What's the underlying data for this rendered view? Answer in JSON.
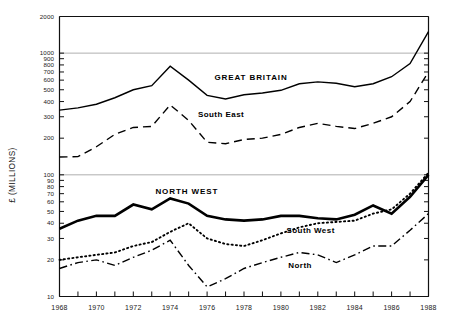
{
  "chart_data": {
    "type": "line",
    "title": "",
    "xlabel": "",
    "ylabel": "£ (MILLIONS)",
    "y_scale": "log",
    "ylim": [
      10,
      2000
    ],
    "xlim": [
      1968,
      1988
    ],
    "grid": "horizontal-at-100-and-1000",
    "legend_position": "inline-annotations",
    "x_tick_labels": [
      "1968",
      "1970",
      "1972",
      "1974",
      "1976",
      "1978",
      "1980",
      "1982",
      "1984",
      "1986",
      "1988"
    ],
    "x_minor_ticks": [
      1969,
      1971,
      1973,
      1975,
      1977,
      1979,
      1981,
      1983,
      1985,
      1987
    ],
    "y_tick_labels": [
      "2000",
      "1000",
      "900",
      "800",
      "700",
      "600",
      "500",
      "400",
      "300",
      "200",
      "100",
      "90",
      "80",
      "70",
      "60",
      "50",
      "40",
      "30",
      "20",
      "10"
    ],
    "y_tick_values": [
      2000,
      1000,
      900,
      800,
      700,
      600,
      500,
      400,
      300,
      200,
      100,
      90,
      80,
      70,
      60,
      50,
      40,
      30,
      20,
      10
    ],
    "x": [
      1968,
      1969,
      1970,
      1971,
      1972,
      1973,
      1974,
      1975,
      1976,
      1977,
      1978,
      1979,
      1980,
      1981,
      1982,
      1983,
      1984,
      1985,
      1986,
      1987,
      1988
    ],
    "series": [
      {
        "name": "GREAT BRITAIN",
        "style": "solid",
        "width": 1.4,
        "label_x": 1976.4,
        "label_y": 600,
        "values": [
          340,
          355,
          380,
          430,
          500,
          540,
          780,
          600,
          450,
          420,
          455,
          470,
          495,
          560,
          580,
          565,
          530,
          560,
          640,
          820,
          1500
        ]
      },
      {
        "name": "South East",
        "style": "dashed",
        "width": 1.4,
        "label_x": 1975.5,
        "label_y": 300,
        "values": [
          140,
          141,
          170,
          215,
          245,
          250,
          375,
          280,
          185,
          180,
          195,
          200,
          215,
          245,
          265,
          250,
          240,
          265,
          300,
          400,
          700
        ]
      },
      {
        "name": "NORTH WEST",
        "style": "solid",
        "width": 2.6,
        "label_x": 1973.2,
        "label_y": 70,
        "values": [
          36,
          42,
          46,
          46,
          57,
          52,
          64,
          58,
          46,
          43,
          42,
          43,
          46,
          46,
          44,
          43,
          47,
          56,
          48,
          66,
          100
        ]
      },
      {
        "name": "South West",
        "style": "dotted",
        "width": 1.9,
        "label_x": 1980.3,
        "label_y": 33,
        "values": [
          20,
          21,
          22,
          23,
          26,
          28,
          34,
          40,
          30,
          27,
          26,
          29,
          33,
          37,
          40,
          41,
          42,
          48,
          52,
          70,
          104
        ]
      },
      {
        "name": "North",
        "style": "dashdot",
        "width": 1.4,
        "label_x": 1980.4,
        "label_y": 17,
        "values": [
          17,
          19,
          20,
          18,
          21,
          24,
          29,
          18,
          12,
          14,
          17,
          19,
          21,
          23,
          22,
          19,
          22,
          26,
          26,
          35,
          48
        ]
      }
    ]
  }
}
